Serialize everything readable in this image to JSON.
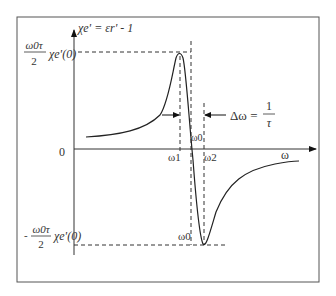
{
  "diagram": {
    "y_axis_label": "χe' = εr' - 1",
    "x_axis_label": "ω",
    "origin_label": "0",
    "max_label": {
      "numerator": "ω0τ",
      "denominator": "2",
      "suffix": "χe'(0)"
    },
    "min_label": {
      "sign": "-",
      "numerator": "ω0τ",
      "denominator": "2",
      "suffix": "χe'(0)"
    },
    "bandwidth_label": {
      "lhs": "Δω =",
      "numerator": "1",
      "denominator": "τ"
    },
    "omega_labels": {
      "omega0_upper": "ω0",
      "omega0_lower": "ω0",
      "omega1": "ω1",
      "omega2": "ω2"
    },
    "colors": {
      "stroke": "#222222",
      "border": "#555555",
      "background": "#ffffff"
    }
  }
}
